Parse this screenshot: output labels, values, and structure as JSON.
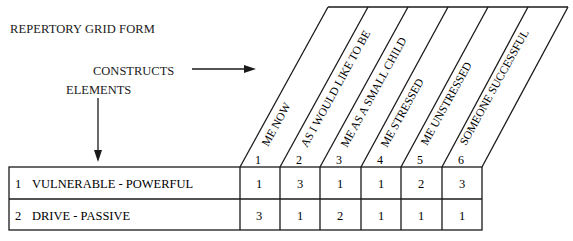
{
  "form": {
    "title": "REPERTORY GRID FORM",
    "constructs_label": "CONSTRUCTS",
    "elements_label": "ELEMENTS"
  },
  "columns": [
    {
      "number": "1",
      "label": "ME NOW"
    },
    {
      "number": "2",
      "label": "AS I WOULD LIKE TO BE"
    },
    {
      "number": "3",
      "label": "ME AS A SMALL CHILD"
    },
    {
      "number": "4",
      "label": "ME STRESSED"
    },
    {
      "number": "5",
      "label": "ME UNSTRESSED"
    },
    {
      "number": "6",
      "label": "SOMEONE SUCCESSFUL"
    }
  ],
  "rows": [
    {
      "number": "1",
      "label": "VULNERABLE - POWERFUL",
      "values": [
        "1",
        "3",
        "1",
        "1",
        "2",
        "3"
      ]
    },
    {
      "number": "2",
      "label": "DRIVE - PASSIVE",
      "values": [
        "3",
        "1",
        "2",
        "1",
        "1",
        "1"
      ]
    }
  ]
}
